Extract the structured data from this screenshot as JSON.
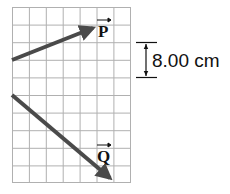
{
  "grid": {
    "columns": 7,
    "rows": 10,
    "line_color": "#b0b0b0"
  },
  "vectors": [
    {
      "name": "P",
      "label": "P",
      "color": "#4a4a4a"
    },
    {
      "name": "Q",
      "label": "Q",
      "color": "#4a4a4a"
    }
  ],
  "scale": {
    "label": "8.00 cm",
    "cells": 2
  }
}
